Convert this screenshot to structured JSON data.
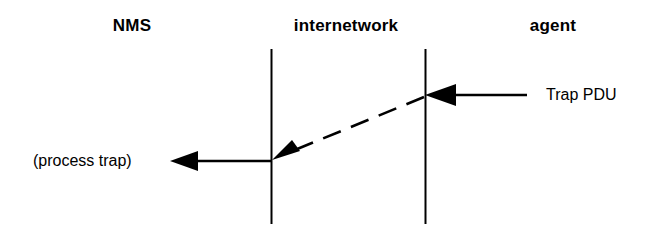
{
  "diagram": {
    "background_color": "#ffffff",
    "stroke_color": "#000000",
    "columns": [
      {
        "id": "nms",
        "label": "NMS"
      },
      {
        "id": "internetwork",
        "label": "internetwork"
      },
      {
        "id": "agent",
        "label": "agent"
      }
    ],
    "labels": {
      "process_trap": "(process trap)",
      "trap_pdu": "Trap PDU"
    },
    "lifelines": [
      {
        "id": "left-boundary",
        "x": 271,
        "y1": 49,
        "y2": 224
      },
      {
        "id": "right-boundary",
        "x": 425,
        "y1": 49,
        "y2": 224
      }
    ],
    "messages": [
      {
        "id": "trap-pdu-in",
        "label": "Trap PDU",
        "style": "solid",
        "direction": "right-to-left",
        "from_x": 527,
        "to_x": 425,
        "y": 95
      },
      {
        "id": "trap-transit",
        "label": "",
        "style": "dashed",
        "direction": "right-to-left",
        "from_x": 424,
        "from_y": 97,
        "to_x": 274,
        "to_y": 158
      },
      {
        "id": "process-trap-out",
        "label": "(process trap)",
        "style": "solid",
        "direction": "right-to-left",
        "from_x": 271,
        "to_x": 170,
        "y": 161
      }
    ]
  }
}
